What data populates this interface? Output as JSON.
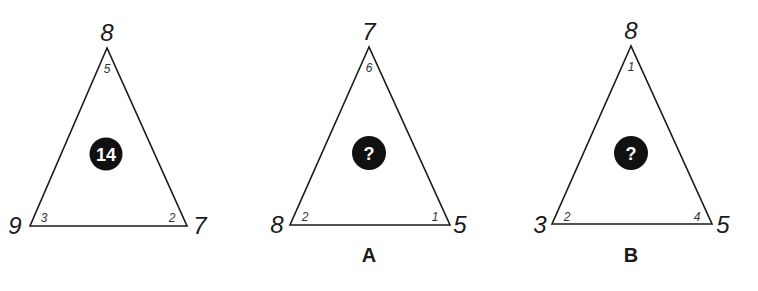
{
  "puzzle": {
    "triangles": [
      {
        "id": "example",
        "caption": "",
        "corners": {
          "top": "8",
          "left": "9",
          "right": "7"
        },
        "angles": {
          "top": "5",
          "left": "3",
          "right": "2"
        },
        "center": "14"
      },
      {
        "id": "A",
        "caption": "A",
        "corners": {
          "top": "7",
          "left": "8",
          "right": "5"
        },
        "angles": {
          "top": "6",
          "left": "2",
          "right": "1"
        },
        "center": "?"
      },
      {
        "id": "B",
        "caption": "B",
        "corners": {
          "top": "8",
          "left": "3",
          "right": "5"
        },
        "angles": {
          "top": "1",
          "left": "2",
          "right": "4"
        },
        "center": "?"
      }
    ],
    "colors": {
      "line": "#1a1a1a",
      "disc": "#111111",
      "disc_text": "#ffffff"
    }
  }
}
